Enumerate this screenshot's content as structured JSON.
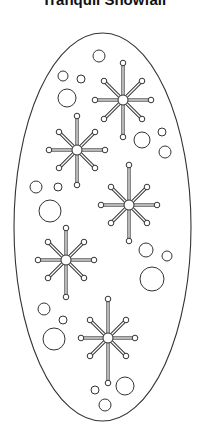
{
  "title": "Tranquil Snowfall",
  "colors": {
    "stroke": "#333333",
    "background": "#ffffff",
    "fill": "#ffffff"
  },
  "oval": {
    "cx": 102.5,
    "cy": 227,
    "rx": 88.5,
    "ry": 194
  },
  "snowflakes": [
    {
      "cx": 123,
      "cy": 100,
      "up": 37,
      "down": 37,
      "side": 28,
      "diag": 19
    },
    {
      "cx": 77,
      "cy": 150,
      "up": 34,
      "down": 35,
      "side": 28,
      "diag": 18
    },
    {
      "cx": 129,
      "cy": 205,
      "up": 40,
      "down": 36,
      "side": 28,
      "diag": 18
    },
    {
      "cx": 66,
      "cy": 260,
      "up": 32,
      "down": 37,
      "side": 28,
      "diag": 18
    },
    {
      "cx": 108,
      "cy": 338,
      "up": 39,
      "down": 45,
      "side": 27,
      "diag": 18
    }
  ],
  "bubbles": [
    {
      "cx": 99,
      "cy": 56,
      "r": 6
    },
    {
      "cx": 63,
      "cy": 76,
      "r": 5
    },
    {
      "cx": 81,
      "cy": 79,
      "r": 4
    },
    {
      "cx": 67,
      "cy": 98,
      "r": 9
    },
    {
      "cx": 142,
      "cy": 140,
      "r": 8
    },
    {
      "cx": 162,
      "cy": 132,
      "r": 4
    },
    {
      "cx": 165,
      "cy": 152,
      "r": 6
    },
    {
      "cx": 36,
      "cy": 187,
      "r": 6
    },
    {
      "cx": 58,
      "cy": 187,
      "r": 4
    },
    {
      "cx": 50,
      "cy": 211,
      "r": 11
    },
    {
      "cx": 146,
      "cy": 250,
      "r": 7
    },
    {
      "cx": 167,
      "cy": 256,
      "r": 5
    },
    {
      "cx": 152,
      "cy": 279,
      "r": 12
    },
    {
      "cx": 44,
      "cy": 309,
      "r": 6
    },
    {
      "cx": 63,
      "cy": 320,
      "r": 4
    },
    {
      "cx": 54,
      "cy": 339,
      "r": 11
    },
    {
      "cx": 95,
      "cy": 390,
      "r": 4
    },
    {
      "cx": 125,
      "cy": 386,
      "r": 9
    },
    {
      "cx": 105,
      "cy": 405,
      "r": 6
    }
  ]
}
